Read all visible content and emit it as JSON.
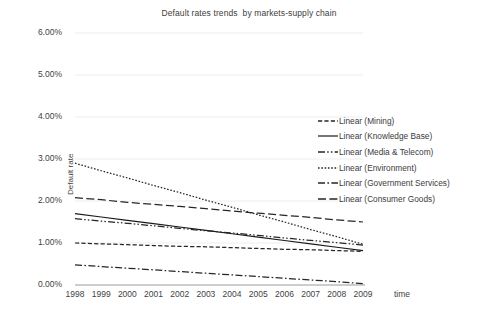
{
  "chart_data": {
    "type": "line",
    "title": "Default rates trends  by markets-supply chain",
    "xlabel": "time",
    "ylabel": "Default rate",
    "x": [
      1998,
      1999,
      2000,
      2001,
      2002,
      2003,
      2004,
      2005,
      2006,
      2007,
      2008,
      2009
    ],
    "xtick_labels": [
      "1998",
      "1999",
      "2000",
      "2001",
      "2002",
      "2003",
      "2004",
      "2005",
      "2006",
      "2007",
      "2008",
      "2009"
    ],
    "ytick_labels": [
      "0.00%",
      "1.00%",
      "2.00%",
      "3.00%",
      "4.00%",
      "5.00%",
      "6.00%"
    ],
    "ytick_values": [
      0,
      1,
      2,
      3,
      4,
      5,
      6
    ],
    "ylim": [
      0,
      6
    ],
    "grid": true,
    "legend_position": "right",
    "series": [
      {
        "name": "Linear (Mining)",
        "dash": "dashed",
        "color": "#262626",
        "values": [
          1.0,
          0.98,
          0.96,
          0.94,
          0.92,
          0.91,
          0.89,
          0.87,
          0.85,
          0.84,
          0.82,
          0.8
        ]
      },
      {
        "name": "Linear (Knowledge Base)",
        "dash": "solid",
        "color": "#1a1a1a",
        "values": [
          1.7,
          1.62,
          1.54,
          1.46,
          1.38,
          1.3,
          1.22,
          1.14,
          1.06,
          0.98,
          0.9,
          0.82
        ]
      },
      {
        "name": "Linear (Media & Telecom)",
        "dash": "dash-dot-dot",
        "color": "#262626",
        "values": [
          1.58,
          1.52,
          1.47,
          1.41,
          1.35,
          1.29,
          1.24,
          1.18,
          1.12,
          1.06,
          1.01,
          0.95
        ]
      },
      {
        "name": "Linear (Environment)",
        "dash": "dotted",
        "color": "#262626",
        "values": [
          2.9,
          2.72,
          2.55,
          2.37,
          2.2,
          2.02,
          1.85,
          1.67,
          1.5,
          1.32,
          1.15,
          0.97
        ]
      },
      {
        "name": "Linear (Government Services)",
        "dash": "dash-dot",
        "color": "#262626",
        "values": [
          0.48,
          0.44,
          0.4,
          0.36,
          0.32,
          0.28,
          0.24,
          0.2,
          0.16,
          0.12,
          0.08,
          0.03
        ]
      },
      {
        "name": "Linear (Consumer Goods)",
        "dash": "long-dash",
        "color": "#262626",
        "values": [
          2.08,
          2.03,
          1.97,
          1.92,
          1.87,
          1.82,
          1.76,
          1.71,
          1.66,
          1.61,
          1.55,
          1.5
        ]
      }
    ]
  }
}
